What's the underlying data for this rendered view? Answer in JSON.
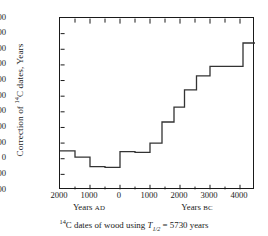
{
  "chart_data": {
    "type": "line",
    "step": true,
    "title": "",
    "caption": {
      "pre_sup": "14",
      "text_a": "C dates of wood using ",
      "symbol": "T",
      "symbol_sub": "1/2",
      "text_b": " = 5730 years"
    },
    "ylabel": {
      "text_a": "Correction of ",
      "sup": "14",
      "text_b": "C dates, Years"
    },
    "xlabel_left": {
      "word": "Years",
      "era": "AD"
    },
    "xlabel_right": {
      "word": "Years",
      "era": "BC"
    },
    "xlim": [
      -2000,
      4500
    ],
    "ylim": [
      -200,
      900
    ],
    "xtick_labels": [
      "2000",
      "1000",
      "0",
      "1000",
      "2000",
      "3000",
      "4000"
    ],
    "xtick_values": [
      -2000,
      -1000,
      0,
      1000,
      2000,
      3000,
      4000
    ],
    "xminor_values": [
      -1500,
      -500,
      500,
      1500,
      2500,
      3500
    ],
    "ytick_labels": [
      "+900",
      "+800",
      "+700",
      "+600",
      "+500",
      "+400",
      "+300",
      "+200",
      "+100",
      "0",
      "-100",
      "-200"
    ],
    "ytick_values": [
      900,
      800,
      700,
      600,
      500,
      400,
      300,
      200,
      100,
      0,
      -100,
      -200
    ],
    "grid": false,
    "legend": null,
    "line_color": "#333333",
    "xlabel": "Years AD / Years BC",
    "steps": [
      {
        "x_start": -2000,
        "x_end": -1500,
        "y": 50
      },
      {
        "x_start": -1500,
        "x_end": -1000,
        "y": 10
      },
      {
        "x_start": -1000,
        "x_end": -500,
        "y": -50
      },
      {
        "x_start": -500,
        "x_end": 0,
        "y": -55
      },
      {
        "x_start": 0,
        "x_end": 500,
        "y": 45
      },
      {
        "x_start": 500,
        "x_end": 1000,
        "y": 40
      },
      {
        "x_start": 1000,
        "x_end": 1400,
        "y": 100
      },
      {
        "x_start": 1400,
        "x_end": 1800,
        "y": 235
      },
      {
        "x_start": 1800,
        "x_end": 2150,
        "y": 330
      },
      {
        "x_start": 2150,
        "x_end": 2550,
        "y": 440
      },
      {
        "x_start": 2550,
        "x_end": 3000,
        "y": 530
      },
      {
        "x_start": 3000,
        "x_end": 4100,
        "y": 590
      },
      {
        "x_start": 4100,
        "x_end": 4500,
        "y": 740
      }
    ]
  }
}
